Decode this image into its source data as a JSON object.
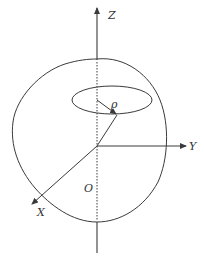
{
  "diagram": {
    "type": "3d-coordinate-figure",
    "colors": {
      "stroke": "#3a3a3a",
      "background": "#ffffff"
    },
    "axes": {
      "z": {
        "label": "Z"
      },
      "y": {
        "label": "Y"
      },
      "x": {
        "label": "X"
      }
    },
    "origin": {
      "label": "O"
    },
    "radius": {
      "label": "ρ"
    },
    "shapes": [
      {
        "name": "body-outline",
        "kind": "closed-curve"
      },
      {
        "name": "cross-section-ellipse",
        "kind": "ellipse"
      },
      {
        "name": "z-axis",
        "kind": "arrow",
        "note": "solid above body, dotted inside body, solid below"
      },
      {
        "name": "y-axis",
        "kind": "arrow"
      },
      {
        "name": "x-axis",
        "kind": "arrow"
      },
      {
        "name": "radius-vector",
        "kind": "arrow"
      },
      {
        "name": "position-vector",
        "kind": "line"
      }
    ]
  }
}
